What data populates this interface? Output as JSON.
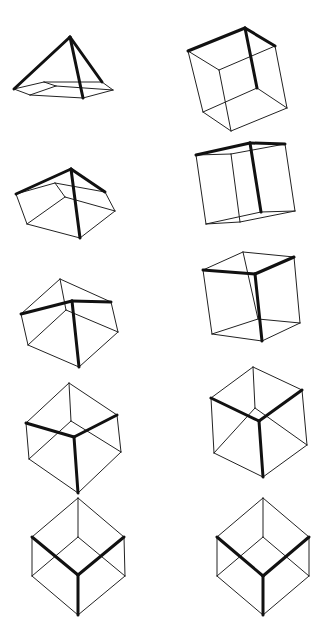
{
  "diagram": {
    "line_color": "#111111",
    "background": "#ffffff",
    "edges": [
      [
        "F",
        "A",
        1
      ],
      [
        "F",
        "B",
        1
      ],
      [
        "F",
        "C",
        1
      ],
      [
        "A",
        "AB",
        0
      ],
      [
        "B",
        "AB",
        0
      ],
      [
        "B",
        "BC",
        0
      ],
      [
        "C",
        "BC",
        0
      ],
      [
        "C",
        "CA",
        0
      ],
      [
        "A",
        "CA",
        0
      ],
      [
        "K",
        "AB",
        0
      ],
      [
        "K",
        "BC",
        0
      ],
      [
        "K",
        "CA",
        0
      ]
    ],
    "figures": [
      {
        "id": "left-1",
        "column": "left",
        "row": 1,
        "v": {
          "F": [
            70,
            37
          ],
          "A": [
            14,
            89
          ],
          "B": [
            102,
            82
          ],
          "C": [
            83,
            98
          ],
          "AB": [
            44,
            82
          ],
          "BC": [
            113,
            90
          ],
          "CA": [
            30,
            95
          ],
          "K": [
            56,
            86
          ]
        }
      },
      {
        "id": "left-2",
        "column": "left",
        "row": 2,
        "v": {
          "F": [
            71,
            169
          ],
          "A": [
            16,
            194
          ],
          "B": [
            105,
            192
          ],
          "C": [
            80,
            238
          ],
          "AB": [
            55,
            183
          ],
          "BC": [
            115,
            211
          ],
          "CA": [
            27,
            224
          ],
          "K": [
            65,
            197
          ]
        }
      },
      {
        "id": "left-3",
        "column": "left",
        "row": 3,
        "v": {
          "F": [
            72,
            301
          ],
          "A": [
            21,
            314
          ],
          "B": [
            111,
            302
          ],
          "C": [
            79,
            367
          ],
          "AB": [
            60,
            279
          ],
          "BC": [
            118,
            332
          ],
          "CA": [
            28,
            345
          ],
          "K": [
            66,
            310
          ]
        }
      },
      {
        "id": "left-4",
        "column": "left",
        "row": 4,
        "v": {
          "F": [
            74,
            437
          ],
          "A": [
            26,
            423
          ],
          "B": [
            117,
            415
          ],
          "C": [
            78,
            493
          ],
          "AB": [
            69,
            383
          ],
          "BC": [
            121,
            452
          ],
          "CA": [
            29,
            459
          ],
          "K": [
            71,
            421
          ]
        }
      },
      {
        "id": "left-5",
        "column": "left",
        "row": 5,
        "v": {
          "F": [
            78,
            575
          ],
          "A": [
            32,
            537
          ],
          "B": [
            124,
            537
          ],
          "C": [
            78,
            615
          ],
          "AB": [
            78,
            498
          ],
          "BC": [
            125,
            576
          ],
          "CA": [
            32,
            576
          ],
          "K": [
            78,
            537
          ]
        }
      },
      {
        "id": "right-1",
        "column": "right",
        "row": 1,
        "v": {
          "F": [
            245,
            28
          ],
          "A": [
            188,
            51
          ],
          "B": [
            275,
            46
          ],
          "C": [
            257,
            88
          ],
          "AB": [
            219,
            70
          ],
          "BC": [
            287,
            108
          ],
          "CA": [
            203,
            112
          ],
          "K": [
            231,
            131
          ]
        }
      },
      {
        "id": "right-2",
        "column": "right",
        "row": 2,
        "v": {
          "F": [
            250,
            143
          ],
          "A": [
            196,
            155
          ],
          "B": [
            285,
            144
          ],
          "C": [
            261,
            212
          ],
          "AB": [
            231,
            154
          ],
          "BC": [
            295,
            211
          ],
          "CA": [
            206,
            224
          ],
          "K": [
            240,
            222
          ]
        }
      },
      {
        "id": "right-3",
        "column": "right",
        "row": 3,
        "v": {
          "F": [
            255,
            274
          ],
          "A": [
            203,
            270
          ],
          "B": [
            294,
            257
          ],
          "C": [
            262,
            341
          ],
          "AB": [
            243,
            252
          ],
          "BC": [
            300,
            323
          ],
          "CA": [
            212,
            334
          ],
          "K": [
            258,
            319
          ]
        }
      },
      {
        "id": "right-4",
        "column": "right",
        "row": 4,
        "v": {
          "F": [
            259,
            421
          ],
          "A": [
            211,
            398
          ],
          "B": [
            302,
            390
          ],
          "C": [
            263,
            477
          ],
          "AB": [
            253,
            367
          ],
          "BC": [
            307,
            445
          ],
          "CA": [
            214,
            453
          ],
          "K": [
            255,
            408
          ]
        }
      },
      {
        "id": "right-5",
        "column": "right",
        "row": 5,
        "v": {
          "F": [
            263,
            576
          ],
          "A": [
            217,
            537
          ],
          "B": [
            309,
            537
          ],
          "C": [
            263,
            615
          ],
          "AB": [
            263,
            498
          ],
          "BC": [
            309,
            576
          ],
          "CA": [
            217,
            576
          ],
          "K": [
            263,
            537
          ]
        }
      }
    ]
  }
}
